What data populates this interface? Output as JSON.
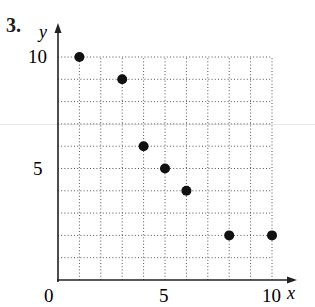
{
  "problem_number": "3.",
  "chart_data": {
    "type": "scatter",
    "title": "",
    "xlabel": "x",
    "ylabel": "y",
    "xlim": [
      0,
      10
    ],
    "ylim": [
      0,
      10
    ],
    "grid": true,
    "grid_style": "dotted",
    "x_ticks": [
      0,
      5,
      10
    ],
    "y_ticks": [
      5,
      10
    ],
    "x_tick_labels": [
      "0",
      "5",
      "10"
    ],
    "y_tick_labels": [
      "5",
      "10"
    ],
    "points": [
      {
        "x": 1,
        "y": 10
      },
      {
        "x": 3,
        "y": 9
      },
      {
        "x": 4,
        "y": 6
      },
      {
        "x": 5,
        "y": 5
      },
      {
        "x": 6,
        "y": 4
      },
      {
        "x": 8,
        "y": 2
      },
      {
        "x": 10,
        "y": 2
      }
    ],
    "marker_color": "#111111"
  }
}
